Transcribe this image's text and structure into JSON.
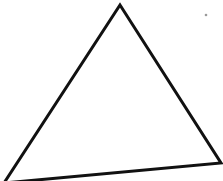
{
  "diagram": {
    "shape": "triangle",
    "stroke_color": "#111111",
    "fill_color": "#ffffff",
    "stroke_width": 3,
    "vertices": {
      "apex": [
        120,
        5
      ],
      "bottom_left": [
        4,
        183
      ],
      "bottom_right": [
        221,
        163
      ]
    },
    "speck": {
      "x": 206,
      "y": 15,
      "color": "#9a9a9a"
    }
  }
}
